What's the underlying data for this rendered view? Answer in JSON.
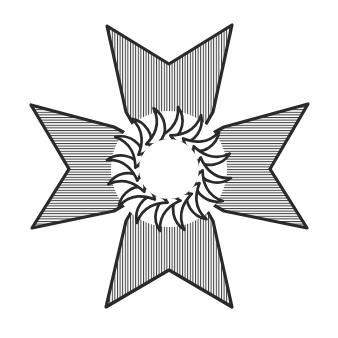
{
  "figure": {
    "description": "Four-armed dart cross with hatched arms surrounding a sixteen-petal flaming sun rosette",
    "canvas": {
      "width": 338,
      "height": 338,
      "background_color": "#ffffff"
    },
    "style": {
      "outline_color": "#2a2a2a",
      "hatch_color": "#3a3a3a",
      "fill_color": "#ffffff",
      "outline_width_px": 3.2,
      "hatch_width_px": 1.0,
      "hatch_spacing_px": 2.6
    },
    "center": {
      "x": 169,
      "y": 169,
      "core_radius_px": 31
    },
    "rosette": {
      "name": "flaming-sun-rosette",
      "petal_count": 16,
      "inner_radius_px": 31,
      "outer_radius_px": 62,
      "fill": "#ffffff",
      "outline": "#2a2a2a",
      "swirl_direction": "counter-clockwise"
    },
    "arms": [
      {
        "name": "arm-top",
        "direction": "up",
        "hatch_orientation": "vertical",
        "tip_left": {
          "x": 107,
          "y": 26
        },
        "tip_right": {
          "x": 232,
          "y": 25
        },
        "notch_vertex": {
          "x": 169,
          "y": 64
        },
        "base_left": {
          "x": 143,
          "y": 120
        },
        "base_right": {
          "x": 196,
          "y": 120
        }
      },
      {
        "name": "arm-bottom",
        "direction": "down",
        "hatch_orientation": "vertical",
        "tip_left": {
          "x": 106,
          "y": 307
        },
        "tip_right": {
          "x": 232,
          "y": 307
        },
        "notch_vertex": {
          "x": 169,
          "y": 270
        },
        "base_left": {
          "x": 143,
          "y": 218
        },
        "base_right": {
          "x": 196,
          "y": 218
        }
      },
      {
        "name": "arm-left",
        "direction": "left",
        "hatch_orientation": "horizontal",
        "tip_top": {
          "x": 31,
          "y": 105
        },
        "tip_bottom": {
          "x": 32,
          "y": 228
        },
        "notch_vertex": {
          "x": 69,
          "y": 169
        },
        "base_top": {
          "x": 120,
          "y": 143
        },
        "base_bottom": {
          "x": 120,
          "y": 196
        }
      },
      {
        "name": "arm-right",
        "direction": "right",
        "hatch_orientation": "horizontal",
        "tip_top": {
          "x": 308,
          "y": 104
        },
        "tip_bottom": {
          "x": 307,
          "y": 228
        },
        "notch_vertex": {
          "x": 270,
          "y": 169
        },
        "base_top": {
          "x": 218,
          "y": 143
        },
        "base_bottom": {
          "x": 218,
          "y": 196
        }
      }
    ],
    "labels": {
      "none_visible": ""
    }
  }
}
